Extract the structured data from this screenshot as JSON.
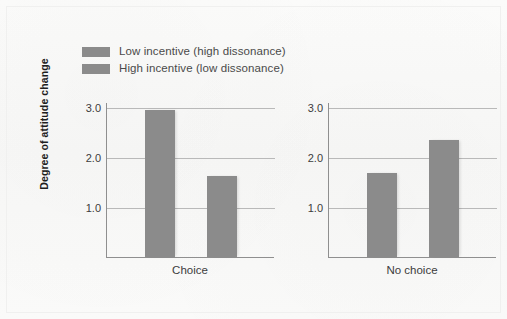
{
  "chart_data": {
    "type": "bar",
    "title": "",
    "xlabel": "",
    "ylabel": "Degree of attitude change",
    "ylim": [
      0,
      3.3
    ],
    "yticks": [
      "1.0",
      "2.0",
      "3.0"
    ],
    "ytick_values": [
      1.0,
      2.0,
      3.0
    ],
    "grid": true,
    "legend_position": "top-left",
    "categories": [
      "Choice",
      "No choice"
    ],
    "series": [
      {
        "name": "Low incentive (high dissonance)",
        "color": "#8b8b8b",
        "values": [
          2.95,
          1.68
        ]
      },
      {
        "name": "High incentive (low dissonance)",
        "color": "#8b8b8b",
        "values": [
          1.62,
          2.34
        ]
      }
    ],
    "panels": [
      {
        "label": "Choice",
        "bars": [
          {
            "series": "Low incentive (high dissonance)",
            "value": 2.95
          },
          {
            "series": "High incentive (low dissonance)",
            "value": 1.62
          }
        ]
      },
      {
        "label": "No choice",
        "bars": [
          {
            "series": "Low incentive (high dissonance)",
            "value": 1.68
          },
          {
            "series": "High incentive (low dissonance)",
            "value": 2.34
          }
        ]
      }
    ]
  },
  "legend": {
    "items": [
      {
        "label": "Low incentive (high dissonance)",
        "color": "#8b8b8b"
      },
      {
        "label": "High incentive (low dissonance)",
        "color": "#8b8b8b"
      }
    ]
  },
  "axes": {
    "y_title": "Degree of attitude change",
    "y_ticks": [
      "3.0",
      "2.0",
      "1.0"
    ]
  },
  "panels": {
    "left": {
      "x_label": "Choice"
    },
    "right": {
      "x_label": "No choice"
    }
  }
}
